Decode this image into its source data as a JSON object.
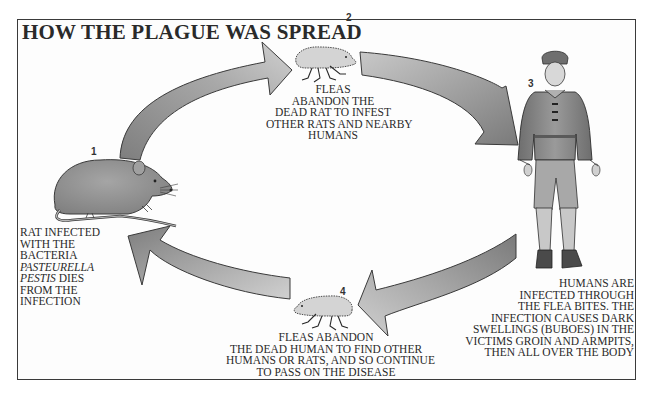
{
  "title": "HOW THE PLAGUE WAS SPREAD",
  "colors": {
    "arrow_fill_light": "#c4c4c4",
    "arrow_fill_dark": "#7e7e7e",
    "arrow_stroke": "#3a3a3a",
    "figure_fill": "#8c8c8c",
    "text": "#2a2a2a",
    "frame": "#3a3a3a"
  },
  "steps": [
    {
      "number": "1",
      "subject": "rat",
      "caption_lines": [
        "RAT INFECTED",
        "WITH THE",
        "BACTERIA"
      ],
      "caption_italic_lines": [
        "PASTEURELLA",
        "PESTIS"
      ],
      "caption_after_italic": " DIES",
      "caption_end_lines": [
        "FROM THE",
        "INFECTION"
      ]
    },
    {
      "number": "2",
      "subject": "flea",
      "caption_lines": [
        "FLEAS",
        "ABANDON THE",
        "DEAD RAT TO INFEST",
        "OTHER RATS AND NEARBY",
        "HUMANS"
      ]
    },
    {
      "number": "3",
      "subject": "human",
      "caption_lines": [
        "HUMANS ARE",
        "INFECTED THROUGH",
        "THE FLEA BITES. THE",
        "INFECTION CAUSES DARK",
        "SWELLINGS (BUBOES) IN THE",
        "VICTIMS GROIN AND ARMPITS,",
        "THEN ALL OVER THE BODY"
      ]
    },
    {
      "number": "4",
      "subject": "flea",
      "caption_lines": [
        "FLEAS ABANDON",
        "THE  DEAD HUMAN TO FIND OTHER",
        "HUMANS OR RATS, AND SO CONTINUE",
        "TO PASS ON THE DISEASE"
      ]
    }
  ],
  "arrows": [
    {
      "from": "1",
      "to": "2",
      "direction": "rat-to-flea"
    },
    {
      "from": "2",
      "to": "3",
      "direction": "flea-to-human"
    },
    {
      "from": "3",
      "to": "4",
      "direction": "human-to-flea"
    },
    {
      "from": "4",
      "to": "1",
      "direction": "flea-to-rat"
    }
  ]
}
